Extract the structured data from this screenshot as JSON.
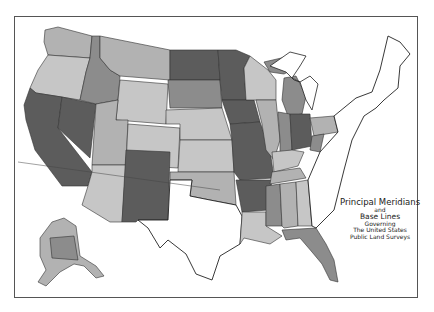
{
  "map": {
    "title": "Principal Meridians and Base Lines Governing The United States Public Land Surveys",
    "legend": {
      "line1": "Principal Meridians",
      "line2": "and",
      "line3": "Base Lines",
      "line4": "Governing",
      "line5": "The United States",
      "line6": "Public Land Surveys"
    },
    "shades": {
      "dark": "#5c5c5c",
      "medium": "#8c8c8c",
      "light": "#b2b2b2",
      "lighter": "#c6c6c6",
      "outline": "#2a2a2a",
      "background": "#ffffff"
    },
    "regions": [
      "Contiguous United States",
      "Alaska"
    ]
  }
}
